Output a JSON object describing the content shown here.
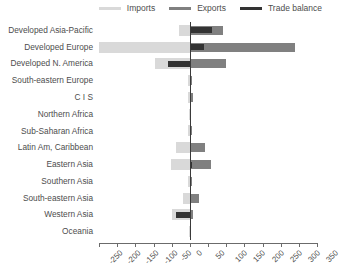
{
  "legend": {
    "items": [
      {
        "label": "Imports",
        "color": "#d9d9d9",
        "name": "legend-imports"
      },
      {
        "label": "Exports",
        "color": "#808080",
        "name": "legend-exports"
      },
      {
        "label": "Trade balance",
        "color": "#333333",
        "name": "legend-trade-balance"
      }
    ]
  },
  "chart_data": {
    "type": "bar",
    "orientation": "horizontal",
    "title": "",
    "xlabel": "",
    "ylabel": "",
    "xlim": [
      -250,
      350
    ],
    "xticks": [
      -250,
      -200,
      -150,
      -100,
      -50,
      0,
      50,
      100,
      150,
      200,
      250,
      300,
      350
    ],
    "xticklabels": [
      "-250",
      "-200",
      "-150",
      "-100",
      "-50",
      "0",
      "50",
      "100",
      "150",
      "200",
      "250",
      "300",
      "350"
    ],
    "grid": false,
    "legend_position": "top-right",
    "categories": [
      "Developed Asia-Pacific",
      "Developed Europe",
      "Developed N. America",
      "South-eastern Europe",
      "C I S",
      "Northern Africa",
      "Sub-Saharan Africa",
      "Latin Am, Caribbean",
      "Eastern Asia",
      "Southern Asia",
      "South-eastern Asia",
      "Western Asia",
      "Oceania"
    ],
    "series": [
      {
        "name": "Imports",
        "color": "#d9d9d9",
        "values": [
          -30,
          -250,
          -95,
          -4,
          -5,
          -3,
          -6,
          -38,
          -52,
          -5,
          -20,
          -48,
          -2
        ]
      },
      {
        "name": "Exports",
        "color": "#808080",
        "values": [
          92,
          290,
          100,
          5,
          8,
          4,
          7,
          42,
          58,
          6,
          24,
          10,
          3
        ]
      },
      {
        "name": "Trade balance",
        "color": "#333333",
        "values": [
          62,
          38,
          -60,
          1,
          3,
          1,
          1,
          4,
          6,
          1,
          4,
          -38,
          1
        ]
      }
    ]
  }
}
